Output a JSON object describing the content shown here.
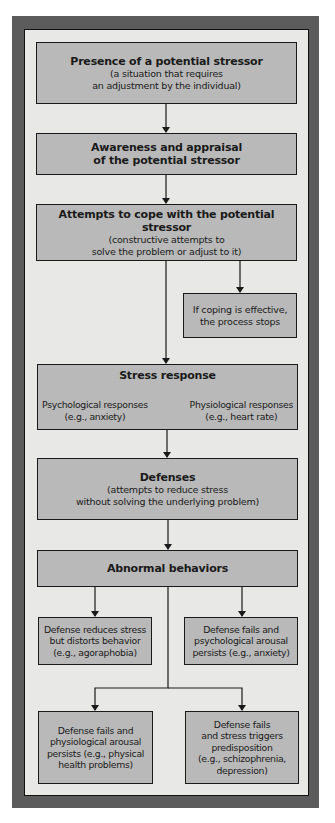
{
  "diagram": {
    "boxes": {
      "stressor": {
        "title": "Presence of a potential stressor",
        "sub1": "(a situation that requires",
        "sub2": "an adjustment by the individual)"
      },
      "appraisal": {
        "line1": "Awareness and appraisal",
        "line2": "of the potential stressor"
      },
      "cope": {
        "title": "Attempts to cope with the potential stressor",
        "sub1": "(constructive attempts to",
        "sub2": "solve the problem or adjust to it)"
      },
      "coping_effective": {
        "line1": "If coping is effective,",
        "line2": "the process stops"
      },
      "stress_response": {
        "title": "Stress response",
        "psych_label": "Psychological responses",
        "psych_example": "(e.g., anxiety)",
        "physio_label": "Physiological responses",
        "physio_example": "(e.g., heart rate)"
      },
      "defenses": {
        "title": "Defenses",
        "sub1": "(attempts to reduce stress",
        "sub2": "without solving the underlying problem)"
      },
      "abnormal": {
        "title": "Abnormal behaviors"
      },
      "outcome_distorts": {
        "line1": "Defense reduces stress",
        "line2": "but distorts behavior",
        "line3": "(e.g., agoraphobia)"
      },
      "outcome_psych": {
        "line1": "Defense fails and",
        "line2": "psychological arousal",
        "line3": "persists (e.g., anxiety)"
      },
      "outcome_physio": {
        "line1": "Defense fails and",
        "line2": "physiological arousal",
        "line3": "persists (e.g., physical",
        "line4": "health problems)"
      },
      "outcome_predisposition": {
        "line1": "Defense fails",
        "line2": "and stress triggers",
        "line3": "predisposition",
        "line4": "(e.g., schizophrenia,",
        "line5": "depression)"
      }
    },
    "colors": {
      "frame": "#5c5c5c",
      "panel": "#e8e8e6",
      "box": "#b9b9b9",
      "line": "#1a1a1a"
    }
  }
}
